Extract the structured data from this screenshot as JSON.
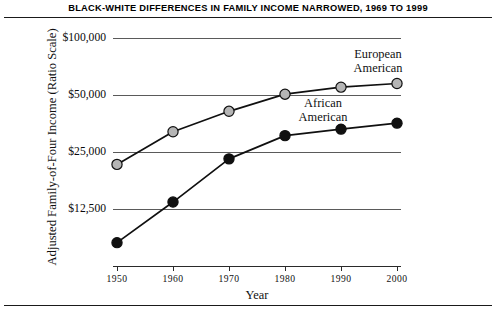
{
  "title": "BLACK-WHITE DIFFERENCES IN FAMILY INCOME NARROWED, 1969 TO 1999",
  "axes": {
    "ylabel": "Adjusted Family-of-Four Income (Ratio Scale)",
    "xlabel": "Year",
    "ytick_labels": [
      "$100,000",
      "$50,000",
      "$25,000",
      "$12,500"
    ],
    "xtick_labels": [
      "1950",
      "1960",
      "1970",
      "1980",
      "1990",
      "2000"
    ]
  },
  "series_labels": {
    "european": "European\nAmerican",
    "european_line1": "European",
    "european_line2": "American",
    "african_line1": "African",
    "african_line2": "American"
  },
  "colors": {
    "european_marker": "#b5b5b5",
    "african_marker": "#101010",
    "line": "#101010",
    "gridline": "#5a5a5a",
    "text": "#111111"
  },
  "chart_data": {
    "type": "line",
    "title": "BLACK-WHITE DIFFERENCES IN FAMILY INCOME NARROWED, 1969 TO 1999",
    "xlabel": "Year",
    "ylabel": "Adjusted Family-of-Four Income (Ratio Scale)",
    "yscale": "log",
    "ylim": [
      7000,
      110000
    ],
    "yticks": [
      12500,
      25000,
      50000,
      100000
    ],
    "ytick_labels": [
      "$12,500",
      "$25,000",
      "$50,000",
      "$100,000"
    ],
    "x": [
      1950,
      1960,
      1970,
      1980,
      1990,
      2000
    ],
    "xtick_labels": [
      "1950",
      "1960",
      "1970",
      "1980",
      "1990",
      "2000"
    ],
    "grid": "horizontal",
    "legend": "inline-annotations",
    "series": [
      {
        "name": "European American",
        "marker": "filled-gray-circle",
        "values": [
          21500,
          32000,
          41000,
          50500,
          55000,
          57500
        ]
      },
      {
        "name": "African American",
        "marker": "filled-black-circle",
        "values": [
          8300,
          13600,
          23000,
          30500,
          33000,
          35500
        ]
      }
    ]
  }
}
